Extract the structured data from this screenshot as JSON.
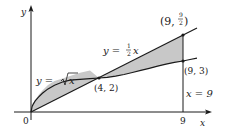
{
  "diagram": {
    "type": "area-between-curves",
    "axes": {
      "x_label": "x",
      "y_label": "y",
      "origin_label": "0",
      "x_tick_label": "9"
    },
    "curves": [
      {
        "name": "sqrt",
        "label_lhs": "y = ",
        "label_rhs": "x",
        "equation": "y = √x"
      },
      {
        "name": "line",
        "label_lhs": "y = ",
        "label_frac_num": "1",
        "label_frac_den": "2",
        "label_rhs": "x",
        "equation": "y = (1/2)x"
      },
      {
        "name": "vertical",
        "label": "x = 9",
        "equation": "x = 9"
      }
    ],
    "points": [
      {
        "label": "(4, 2)",
        "x": 4,
        "y": 2
      },
      {
        "label_prefix": "(9, ",
        "label_num": "9",
        "label_den": "2",
        "label_suffix": ")",
        "x": 9,
        "y": 4.5
      },
      {
        "label": "(9, 3)",
        "x": 9,
        "y": 3
      }
    ],
    "colors": {
      "shade": "#c8c8c8",
      "stroke": "#1a1a1a"
    }
  }
}
